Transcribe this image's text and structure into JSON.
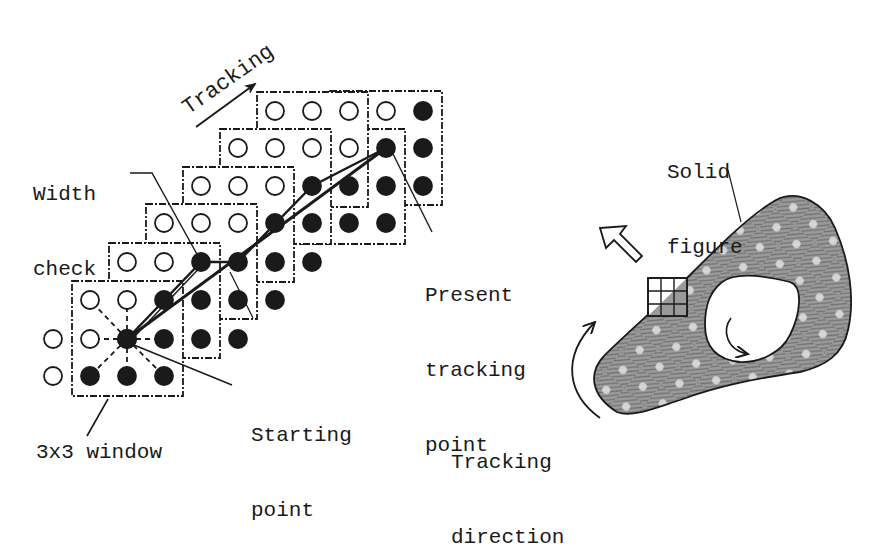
{
  "labels": {
    "tracking": "Tracking",
    "width_check": [
      "Width",
      "check"
    ],
    "present_tracking_point": [
      "Present",
      "tracking",
      "point"
    ],
    "starting_point": [
      "Starting",
      "point"
    ],
    "window_3x3": "3x3 window",
    "solid_figure": [
      "Solid",
      "figure"
    ],
    "tracking_direction": [
      "Tracking",
      "direction"
    ]
  },
  "colors": {
    "ink": "#1a1a1a",
    "figure_fill": "#8c8c8c",
    "figure_dot": "#d8d8d8",
    "background": "#ffffff"
  },
  "grid": {
    "cols_x": [
      53,
      90,
      127,
      164,
      201,
      238,
      275,
      312,
      349,
      386,
      423
    ],
    "rows_y": [
      111,
      148,
      186,
      223,
      262,
      300,
      339,
      376
    ],
    "radius": 9,
    "points": [
      {
        "c": 6,
        "r": 0,
        "filled": false
      },
      {
        "c": 7,
        "r": 0,
        "filled": false
      },
      {
        "c": 8,
        "r": 0,
        "filled": false
      },
      {
        "c": 9,
        "r": 0,
        "filled": false
      },
      {
        "c": 10,
        "r": 0,
        "filled": true
      },
      {
        "c": 5,
        "r": 1,
        "filled": false
      },
      {
        "c": 6,
        "r": 1,
        "filled": false
      },
      {
        "c": 7,
        "r": 1,
        "filled": false
      },
      {
        "c": 8,
        "r": 1,
        "filled": false
      },
      {
        "c": 9,
        "r": 1,
        "filled": true
      },
      {
        "c": 10,
        "r": 1,
        "filled": true
      },
      {
        "c": 4,
        "r": 2,
        "filled": false
      },
      {
        "c": 5,
        "r": 2,
        "filled": false
      },
      {
        "c": 6,
        "r": 2,
        "filled": false
      },
      {
        "c": 7,
        "r": 2,
        "filled": true
      },
      {
        "c": 8,
        "r": 2,
        "filled": true
      },
      {
        "c": 9,
        "r": 2,
        "filled": true
      },
      {
        "c": 10,
        "r": 2,
        "filled": true
      },
      {
        "c": 3,
        "r": 3,
        "filled": false
      },
      {
        "c": 4,
        "r": 3,
        "filled": false
      },
      {
        "c": 5,
        "r": 3,
        "filled": false
      },
      {
        "c": 6,
        "r": 3,
        "filled": true
      },
      {
        "c": 7,
        "r": 3,
        "filled": true
      },
      {
        "c": 8,
        "r": 3,
        "filled": true
      },
      {
        "c": 9,
        "r": 3,
        "filled": true
      },
      {
        "c": 2,
        "r": 4,
        "filled": false
      },
      {
        "c": 3,
        "r": 4,
        "filled": false
      },
      {
        "c": 4,
        "r": 4,
        "filled": true
      },
      {
        "c": 5,
        "r": 4,
        "filled": true
      },
      {
        "c": 6,
        "r": 4,
        "filled": true
      },
      {
        "c": 7,
        "r": 4,
        "filled": true
      },
      {
        "c": 1,
        "r": 5,
        "filled": false
      },
      {
        "c": 2,
        "r": 5,
        "filled": false
      },
      {
        "c": 3,
        "r": 5,
        "filled": true
      },
      {
        "c": 4,
        "r": 5,
        "filled": true
      },
      {
        "c": 5,
        "r": 5,
        "filled": true
      },
      {
        "c": 6,
        "r": 5,
        "filled": true
      },
      {
        "c": 0,
        "r": 6,
        "filled": false
      },
      {
        "c": 1,
        "r": 6,
        "filled": false
      },
      {
        "c": 2,
        "r": 6,
        "filled": true
      },
      {
        "c": 3,
        "r": 6,
        "filled": true
      },
      {
        "c": 4,
        "r": 6,
        "filled": true
      },
      {
        "c": 5,
        "r": 6,
        "filled": true
      },
      {
        "c": 0,
        "r": 7,
        "filled": false
      },
      {
        "c": 1,
        "r": 7,
        "filled": true
      },
      {
        "c": 2,
        "r": 7,
        "filled": true
      },
      {
        "c": 3,
        "r": 7,
        "filled": true
      }
    ],
    "windows": [
      {
        "x": 72,
        "y": 281,
        "w": 111,
        "h": 115
      },
      {
        "x": 109,
        "y": 243,
        "w": 111,
        "h": 115
      },
      {
        "x": 146,
        "y": 204,
        "w": 111,
        "h": 115
      },
      {
        "x": 183,
        "y": 167,
        "w": 111,
        "h": 115
      },
      {
        "x": 220,
        "y": 129,
        "w": 111,
        "h": 115
      },
      {
        "x": 257,
        "y": 92,
        "w": 111,
        "h": 115
      },
      {
        "x": 294,
        "y": 129,
        "w": 111,
        "h": 115
      },
      {
        "x": 330,
        "y": 91,
        "w": 112,
        "h": 114
      }
    ],
    "start_point": {
      "c": 2,
      "r": 6
    },
    "present_point": {
      "c": 9,
      "r": 1
    },
    "width_check_point": {
      "c": 4,
      "r": 4
    }
  }
}
